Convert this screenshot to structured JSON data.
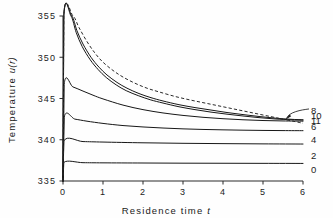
{
  "chart_data": {
    "type": "line",
    "title": "",
    "xlabel": "Residence time t",
    "ylabel": "Temperature u(r)",
    "xlim": [
      0,
      6
    ],
    "ylim": [
      335,
      355
    ],
    "xticks": [
      "0",
      "1",
      "2",
      "3",
      "4",
      "5",
      "6"
    ],
    "yticks": [
      "335",
      "340",
      "345",
      "350",
      "355"
    ],
    "grid": false,
    "legend_position": "right-inline-labels",
    "annotations": [
      {
        "text": "arrow from label 8 to curve bundle",
        "from_label": "8",
        "to": [
          5.55,
          342.4
        ]
      }
    ],
    "series": [
      {
        "name": "0",
        "label": "0",
        "style": "solid",
        "label_value": 337.2,
        "points": [
          [
            0,
            335.0
          ],
          [
            0.02,
            337.25
          ],
          [
            0.5,
            337.22
          ],
          [
            1,
            337.2
          ],
          [
            2,
            337.18
          ],
          [
            3,
            337.16
          ],
          [
            4,
            337.15
          ],
          [
            5,
            337.14
          ],
          [
            6,
            337.13
          ]
        ]
      },
      {
        "name": "2",
        "label": "2",
        "style": "solid",
        "label_value": 339.8,
        "points": [
          [
            0,
            335.0
          ],
          [
            0.02,
            339.85
          ],
          [
            0.5,
            339.78
          ],
          [
            1,
            339.72
          ],
          [
            2,
            339.63
          ],
          [
            3,
            339.57
          ],
          [
            4,
            339.53
          ],
          [
            5,
            339.5
          ],
          [
            6,
            339.48
          ]
        ]
      },
      {
        "name": "4",
        "label": "4",
        "style": "solid",
        "label_value": 342.7,
        "points": [
          [
            0,
            335.0
          ],
          [
            0.03,
            342.72
          ],
          [
            0.3,
            342.5
          ],
          [
            0.6,
            342.25
          ],
          [
            1,
            341.98
          ],
          [
            1.5,
            341.72
          ],
          [
            2,
            341.55
          ],
          [
            2.5,
            341.42
          ],
          [
            3,
            341.32
          ],
          [
            3.5,
            341.25
          ],
          [
            4,
            341.2
          ],
          [
            4.5,
            341.16
          ],
          [
            5,
            341.13
          ],
          [
            5.5,
            341.11
          ],
          [
            6,
            341.1
          ]
        ]
      },
      {
        "name": "6",
        "label": "6",
        "style": "solid",
        "label_value": 346.7,
        "points": [
          [
            0,
            335.0
          ],
          [
            0.03,
            346.72
          ],
          [
            0.25,
            346.4
          ],
          [
            0.5,
            345.9
          ],
          [
            0.75,
            345.4
          ],
          [
            1,
            344.95
          ],
          [
            1.5,
            344.2
          ],
          [
            2,
            343.65
          ],
          [
            2.5,
            343.25
          ],
          [
            3,
            342.95
          ],
          [
            3.5,
            342.72
          ],
          [
            4,
            342.55
          ],
          [
            4.5,
            342.42
          ],
          [
            5,
            342.33
          ],
          [
            5.5,
            342.28
          ],
          [
            6,
            342.25
          ]
        ]
      },
      {
        "name": "8",
        "label": "8",
        "style": "solid",
        "label_value": 355.0,
        "points": [
          [
            0,
            335.0
          ],
          [
            0.02,
            355.0
          ],
          [
            0.22,
            355.0
          ],
          [
            0.35,
            353.2
          ],
          [
            0.5,
            351.6
          ],
          [
            0.7,
            350.0
          ],
          [
            0.9,
            348.8
          ],
          [
            1.1,
            347.85
          ],
          [
            1.35,
            346.95
          ],
          [
            1.6,
            346.25
          ],
          [
            1.9,
            345.6
          ],
          [
            2.2,
            345.1
          ],
          [
            2.5,
            344.7
          ],
          [
            2.9,
            344.25
          ],
          [
            3.3,
            343.9
          ],
          [
            3.7,
            343.6
          ],
          [
            4.1,
            343.3
          ],
          [
            4.5,
            343.05
          ],
          [
            4.9,
            342.82
          ],
          [
            5.3,
            342.62
          ],
          [
            5.7,
            342.48
          ],
          [
            6,
            342.42
          ]
        ]
      },
      {
        "name": "10",
        "label": "10",
        "style": "solid",
        "label_value": 355.0,
        "points": [
          [
            0,
            335.0
          ],
          [
            0.02,
            355.0
          ],
          [
            0.2,
            355.0
          ],
          [
            0.33,
            353.0
          ],
          [
            0.48,
            351.3
          ],
          [
            0.68,
            349.7
          ],
          [
            0.88,
            348.5
          ],
          [
            1.08,
            347.55
          ],
          [
            1.33,
            346.65
          ],
          [
            1.58,
            345.95
          ],
          [
            1.88,
            345.35
          ],
          [
            2.18,
            344.85
          ],
          [
            2.5,
            344.45
          ],
          [
            2.9,
            344.0
          ],
          [
            3.3,
            343.65
          ],
          [
            3.7,
            343.35
          ],
          [
            4.1,
            343.1
          ],
          [
            4.5,
            342.88
          ],
          [
            4.9,
            342.68
          ],
          [
            5.3,
            342.52
          ],
          [
            5.7,
            342.42
          ],
          [
            6,
            342.38
          ]
        ]
      },
      {
        "name": "11",
        "label": "11",
        "style": "dashed",
        "label_value": 355.0,
        "points": [
          [
            0,
            335.0
          ],
          [
            0.02,
            355.0
          ],
          [
            0.25,
            355.0
          ],
          [
            0.4,
            353.6
          ],
          [
            0.6,
            351.9
          ],
          [
            0.8,
            350.5
          ],
          [
            1.0,
            349.4
          ],
          [
            1.25,
            348.4
          ],
          [
            1.5,
            347.6
          ],
          [
            1.8,
            346.85
          ],
          [
            2.1,
            346.25
          ],
          [
            2.4,
            345.8
          ],
          [
            2.8,
            345.25
          ],
          [
            3.2,
            344.8
          ],
          [
            3.6,
            344.4
          ],
          [
            4.0,
            344.0
          ],
          [
            4.4,
            343.6
          ],
          [
            4.8,
            343.2
          ],
          [
            5.2,
            342.8
          ],
          [
            5.5,
            342.5
          ],
          [
            5.8,
            342.2
          ],
          [
            6,
            342.0
          ]
        ]
      }
    ],
    "right_labels": [
      {
        "text": "8",
        "y": 343.55
      },
      {
        "text": "10",
        "y": 342.95
      },
      {
        "text": "11",
        "y": 342.35
      },
      {
        "text": "6",
        "y": 341.6
      },
      {
        "text": "4",
        "y": 340.0
      },
      {
        "text": "2",
        "y": 338.1
      },
      {
        "text": "0",
        "y": 336.3
      }
    ]
  }
}
